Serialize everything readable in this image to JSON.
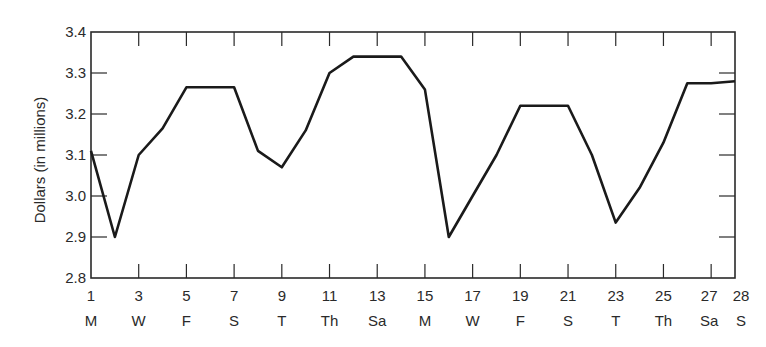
{
  "chart_data": {
    "type": "line",
    "title": "",
    "xlabel": "",
    "ylabel": "Dollars (in millions)",
    "ylim": [
      2.8,
      3.4
    ],
    "xlim": [
      1,
      28
    ],
    "grid": false,
    "legend": null,
    "y_ticks": [
      "2.8",
      "2.9",
      "3.0",
      "3.1",
      "3.2",
      "3.3",
      "3.4"
    ],
    "x_tick_days": [
      "1",
      "3",
      "5",
      "7",
      "9",
      "11",
      "13",
      "15",
      "17",
      "19",
      "21",
      "23",
      "25",
      "27",
      "28"
    ],
    "x_tick_weekdays": [
      "M",
      "W",
      "F",
      "S",
      "T",
      "Th",
      "Sa",
      "M",
      "W",
      "F",
      "S",
      "T",
      "Th",
      "Sa",
      "S"
    ],
    "series": [
      {
        "name": "Dollars (in millions)",
        "x": [
          1,
          2,
          3,
          4,
          5,
          6,
          7,
          8,
          9,
          10,
          11,
          12,
          13,
          14,
          15,
          16,
          17,
          18,
          19,
          20,
          21,
          22,
          23,
          24,
          25,
          26,
          27,
          28
        ],
        "values": [
          3.11,
          2.9,
          3.1,
          3.165,
          3.265,
          3.265,
          3.265,
          3.11,
          3.07,
          3.16,
          3.3,
          3.34,
          3.34,
          3.34,
          3.26,
          2.9,
          3.0,
          3.1,
          3.22,
          3.22,
          3.22,
          3.1,
          2.935,
          3.02,
          3.13,
          3.275,
          3.275,
          3.28
        ]
      }
    ]
  }
}
